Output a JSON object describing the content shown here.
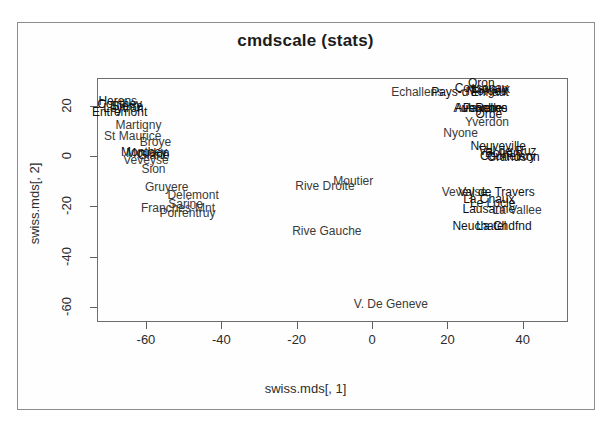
{
  "figure": {
    "title": "cmdscale (stats)",
    "xlabel": "swiss.mds[, 1]",
    "ylabel": "swiss.mds[, 2]"
  },
  "chart_data": {
    "type": "scatter",
    "title": "cmdscale (stats)",
    "xlabel": "swiss.mds[, 1]",
    "ylabel": "swiss.mds[, 2]",
    "grid": false,
    "legend": "none",
    "marker": "text-label",
    "xlim": [
      -73,
      52
    ],
    "ylim": [
      -66,
      31
    ],
    "xticks": [
      -60,
      -40,
      -20,
      0,
      20,
      40
    ],
    "yticks": [
      20,
      0,
      -20,
      -40,
      -60
    ],
    "xtick_labels": [
      "-60",
      "-40",
      "-20",
      "0",
      "20",
      "40"
    ],
    "ytick_labels": [
      "20",
      "0",
      "-20",
      "-40",
      "-60"
    ],
    "points": [
      {
        "label": "Herens",
        "x": -67.5,
        "y": 22.0
      },
      {
        "label": "Conthey",
        "x": -67.0,
        "y": 20.5
      },
      {
        "label": "Sierre",
        "x": -65.0,
        "y": 19.8
      },
      {
        "label": "Leytron",
        "x": -66.0,
        "y": 19.0
      },
      {
        "label": "Entremont",
        "x": -67.0,
        "y": 17.5
      },
      {
        "label": "Martigny",
        "x": -62.0,
        "y": 12.5
      },
      {
        "label": "St Maurice",
        "x": -63.5,
        "y": 8.0
      },
      {
        "label": "Broye",
        "x": -57.5,
        "y": 5.5
      },
      {
        "label": "Monthey",
        "x": -60.5,
        "y": 1.5
      },
      {
        "label": "Moudon",
        "x": -59.5,
        "y": 1.0
      },
      {
        "label": "Glane",
        "x": -58.0,
        "y": 0.5
      },
      {
        "label": "Veveyse",
        "x": -60.0,
        "y": -1.5
      },
      {
        "label": "Sion",
        "x": -58.0,
        "y": -5.0
      },
      {
        "label": "Gruyere",
        "x": -54.5,
        "y": -12.5
      },
      {
        "label": "Delemont",
        "x": -47.5,
        "y": -15.5
      },
      {
        "label": "Sarine",
        "x": -49.5,
        "y": -19.0
      },
      {
        "label": "Franches-Mnt",
        "x": -51.5,
        "y": -20.5
      },
      {
        "label": "Porrentruy",
        "x": -49.0,
        "y": -22.5
      },
      {
        "label": "Rive Droite",
        "x": -12.5,
        "y": -12.0
      },
      {
        "label": "Moutier",
        "x": -5.0,
        "y": -10.0
      },
      {
        "label": "Rive Gauche",
        "x": -12.0,
        "y": -30.0
      },
      {
        "label": "V. De Geneve",
        "x": 5.0,
        "y": -59.0
      },
      {
        "label": "Echallens",
        "x": 12.0,
        "y": 25.5
      },
      {
        "label": "Oron",
        "x": 29.0,
        "y": 29.0
      },
      {
        "label": "Cossonay",
        "x": 29.0,
        "y": 27.0
      },
      {
        "label": "Lavaux",
        "x": 31.5,
        "y": 26.5
      },
      {
        "label": "Morges",
        "x": 30.5,
        "y": 26.0
      },
      {
        "label": "Pays-d'Enhaut",
        "x": 26.0,
        "y": 25.3
      },
      {
        "label": "Aubonne",
        "x": 28.0,
        "y": 19.0
      },
      {
        "label": "Avenches",
        "x": 29.0,
        "y": 19.0
      },
      {
        "label": "Payerne",
        "x": 30.0,
        "y": 19.0
      },
      {
        "label": "Rolle",
        "x": 31.0,
        "y": 19.0
      },
      {
        "label": "Orbe",
        "x": 31.0,
        "y": 16.5
      },
      {
        "label": "Yverdon",
        "x": 30.5,
        "y": 13.5
      },
      {
        "label": "Nyone",
        "x": 23.5,
        "y": 9.0
      },
      {
        "label": "Neuveville",
        "x": 33.5,
        "y": 4.0
      },
      {
        "label": "Val de Ruz",
        "x": 36.0,
        "y": 2.0
      },
      {
        "label": "Boudry",
        "x": 35.0,
        "y": 1.0
      },
      {
        "label": "Courtelary",
        "x": 36.0,
        "y": 0.0
      },
      {
        "label": "Grandson",
        "x": 37.5,
        "y": -0.5
      },
      {
        "label": "Veveyse",
        "x": 24.5,
        "y": -14.5
      },
      {
        "label": "Val de Travers",
        "x": 33.0,
        "y": -14.5
      },
      {
        "label": "La Chaux",
        "x": 31.0,
        "y": -17.0
      },
      {
        "label": "Le Locle",
        "x": 32.0,
        "y": -18.5
      },
      {
        "label": "Lausanne",
        "x": 31.0,
        "y": -21.0
      },
      {
        "label": "La Vallee",
        "x": 38.5,
        "y": -21.5
      },
      {
        "label": "Neuchatel",
        "x": 28.5,
        "y": -28.0
      },
      {
        "label": "La Chdfnd",
        "x": 35.0,
        "y": -28.0
      }
    ]
  }
}
